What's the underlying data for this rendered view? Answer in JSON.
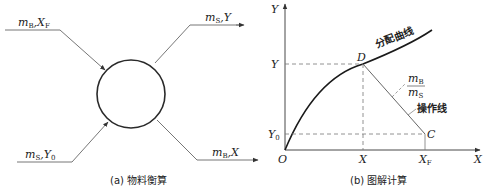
{
  "panel_a": {
    "caption": "(a) 物料衡算",
    "streams": [
      {
        "id": "feed",
        "symbol": "m",
        "sub1": "B",
        "sep": ",",
        "var": "X",
        "sub2": "F",
        "direction": "in"
      },
      {
        "id": "extract",
        "symbol": "m",
        "sub1": "S",
        "sep": ",",
        "var": "Y",
        "sub2": "",
        "direction": "out"
      },
      {
        "id": "solvent",
        "symbol": "m",
        "sub1": "S",
        "sep": ",",
        "var": "Y",
        "sub2": "0",
        "direction": "in"
      },
      {
        "id": "raffinate",
        "symbol": "m",
        "sub1": "B",
        "sep": ",",
        "var": "X",
        "sub2": "",
        "direction": "out"
      }
    ]
  },
  "panel_b": {
    "caption": "(b) 图解计算",
    "y_axis_label": "Y",
    "x_axis_label": "X",
    "origin_label": "O",
    "curve_label": "分配曲线",
    "operating_line_label": "操作线",
    "slope_label": {
      "num": "m",
      "num_sub": "B",
      "den": "m",
      "den_sub": "S"
    },
    "point_D": "D",
    "point_C": "C",
    "y_ticks": [
      {
        "label": "Y",
        "sub": ""
      },
      {
        "label": "Y",
        "sub": "0"
      }
    ],
    "x_ticks": [
      {
        "label": "X",
        "sub": ""
      },
      {
        "label": "X",
        "sub": "F"
      }
    ]
  },
  "colors": {
    "line": "#2a2a2a",
    "thin": "#555555",
    "dashed": "#777777"
  }
}
